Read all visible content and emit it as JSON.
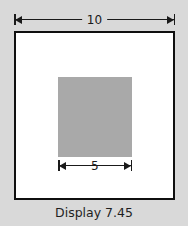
{
  "figure": {
    "caption": "Display 7.45",
    "background_color": "#d9d9d9",
    "outer_square": {
      "name": "outer square",
      "fill_color": "#ffffff",
      "border_color": "#0f0f0f",
      "side_label": "10"
    },
    "inner_square": {
      "name": "inner shaded square",
      "fill_color": "#a9a9a9",
      "side_label": "5"
    },
    "dimensions": [
      {
        "id": "outer-width",
        "label": "10",
        "position": "top",
        "describes": "outer square width"
      },
      {
        "id": "inner-width",
        "label": "5",
        "position": "below inner square",
        "describes": "inner shaded square width"
      }
    ]
  }
}
